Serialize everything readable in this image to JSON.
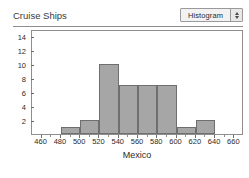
{
  "header": {
    "title": "Cruise Ships",
    "plot_type_selected": "Histogram",
    "stepper_icon_up": "triangle-up-icon",
    "stepper_icon_down": "triangle-down-icon"
  },
  "colors": {
    "bar_fill": "#a6a6a6",
    "bar_border": "#6f6f6f",
    "axis": "#8e8e8e",
    "text": "#2b2b2b",
    "title_text": "#3a3a3a",
    "background": "#ffffff",
    "control_face": "#f2f2f2"
  },
  "chart_data": {
    "type": "bar",
    "title": "Cruise Ships",
    "xlabel": "Mexico",
    "ylabel": "Frequency of Mexico",
    "grid": false,
    "legend": null,
    "bin_width": 20,
    "xlim": [
      450,
      670
    ],
    "ylim": [
      0,
      15
    ],
    "x_ticks": [
      460,
      480,
      500,
      520,
      540,
      560,
      580,
      600,
      620,
      640,
      660
    ],
    "y_ticks": [
      2,
      4,
      6,
      8,
      10,
      12,
      14
    ],
    "bins": [
      {
        "start": 480,
        "end": 500,
        "value": 1
      },
      {
        "start": 500,
        "end": 520,
        "value": 2
      },
      {
        "start": 520,
        "end": 540,
        "value": 10
      },
      {
        "start": 540,
        "end": 560,
        "value": 7
      },
      {
        "start": 560,
        "end": 580,
        "value": 7
      },
      {
        "start": 580,
        "end": 600,
        "value": 7
      },
      {
        "start": 600,
        "end": 620,
        "value": 1
      },
      {
        "start": 620,
        "end": 640,
        "value": 2
      }
    ],
    "categories": [
      "480-500",
      "500-520",
      "520-540",
      "540-560",
      "560-580",
      "580-600",
      "600-620",
      "620-640"
    ],
    "values": [
      1,
      2,
      10,
      7,
      7,
      7,
      1,
      2
    ]
  }
}
